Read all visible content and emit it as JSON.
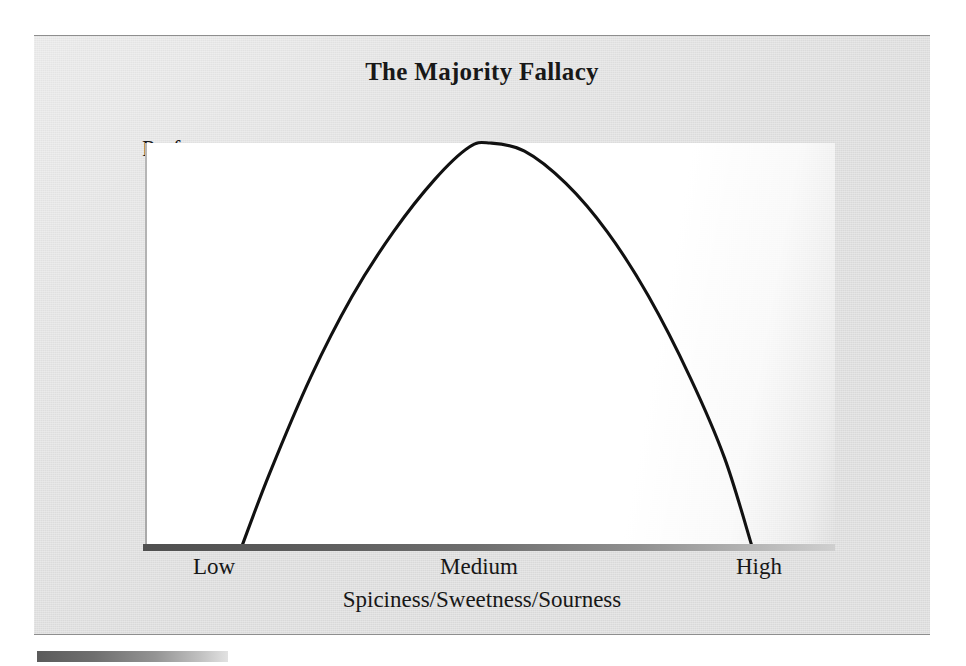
{
  "figure": {
    "title": "The Majority Fallacy",
    "y_axis_label": "Preferences",
    "x_axis_title": "Spiciness/Sweetness/Sourness",
    "x_tick_labels": [
      "Low",
      "Medium",
      "High"
    ],
    "colors": {
      "panel_background": "#dcdcdc",
      "plot_background": "#ffffff",
      "curve": "#111111",
      "axis_bar_dark": "#4f4f4f",
      "axis_bar_light": "#cfcfcf",
      "text": "#171717",
      "panel_border": "#8e8e8e"
    }
  },
  "chart_data": {
    "type": "line",
    "title": "The Majority Fallacy",
    "xlabel": "Spiciness/Sweetness/Sourness",
    "ylabel": "Preferences",
    "grid": false,
    "legend": null,
    "xlim": [
      0,
      1
    ],
    "ylim": [
      0,
      1
    ],
    "xtick_labels": [
      "Low",
      "Medium",
      "High"
    ],
    "xtick_positions": [
      0.14,
      0.5,
      0.88
    ],
    "ytick_labels": [],
    "annotations": [],
    "series": [
      {
        "name": "Preferences",
        "x": [
          0.14,
          0.18,
          0.24,
          0.3,
          0.36,
          0.42,
          0.47,
          0.5,
          0.55,
          0.61,
          0.67,
          0.73,
          0.79,
          0.84,
          0.88
        ],
        "y": [
          0.0,
          0.18,
          0.42,
          0.62,
          0.78,
          0.91,
          0.99,
          1.0,
          0.98,
          0.9,
          0.78,
          0.62,
          0.42,
          0.22,
          0.0
        ]
      }
    ]
  }
}
